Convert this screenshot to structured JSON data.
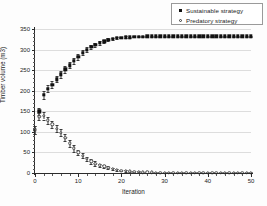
{
  "legend": {
    "position": "top-right",
    "entries": [
      {
        "label": "Sustainable strategy",
        "marker": "filled-square-icon"
      },
      {
        "label": "Predatory strategy",
        "marker": "open-circle-icon"
      }
    ]
  },
  "chart_data": {
    "type": "line",
    "title": "",
    "xlabel": "Iteration",
    "ylabel": "Timber volume (m3)",
    "xlim": [
      0,
      50
    ],
    "ylim": [
      0,
      350
    ],
    "xticks": [
      0,
      10,
      20,
      30,
      40,
      50
    ],
    "yticks": [
      0,
      50,
      100,
      150,
      200,
      250,
      300,
      350
    ],
    "grid": "horizontal",
    "marker_style": "points-with-error-bars",
    "x": [
      0,
      1,
      2,
      3,
      4,
      5,
      6,
      7,
      8,
      9,
      10,
      11,
      12,
      13,
      14,
      15,
      16,
      17,
      18,
      19,
      20,
      21,
      22,
      23,
      24,
      25,
      26,
      27,
      28,
      29,
      30,
      31,
      32,
      33,
      34,
      35,
      36,
      37,
      38,
      39,
      40,
      41,
      42,
      43,
      44,
      45,
      46,
      47,
      48,
      49,
      50
    ],
    "series": [
      {
        "name": "Sustainable strategy",
        "marker": "filled-square",
        "values": [
          105,
          150,
          190,
          205,
          215,
          228,
          240,
          252,
          262,
          272,
          282,
          292,
          300,
          306,
          312,
          316,
          320,
          324,
          326,
          328,
          329,
          330,
          330,
          331,
          331,
          331,
          332,
          332,
          332,
          332,
          332,
          332,
          332,
          332,
          332,
          332,
          332,
          332,
          332,
          332,
          332,
          332,
          332,
          332,
          332,
          332,
          332,
          332,
          332,
          332,
          332
        ],
        "errors": [
          10,
          9,
          9,
          8,
          8,
          8,
          8,
          8,
          8,
          7,
          7,
          6,
          6,
          5,
          5,
          4,
          4,
          3,
          3,
          2,
          2,
          2,
          1,
          1,
          1,
          1,
          1,
          1,
          1,
          1,
          1,
          1,
          1,
          1,
          1,
          1,
          1,
          1,
          1,
          1,
          1,
          1,
          1,
          1,
          1,
          1,
          1,
          1,
          1,
          1,
          1
        ]
      },
      {
        "name": "Predatory strategy",
        "marker": "open-circle",
        "values": [
          105,
          137,
          139,
          128,
          118,
          108,
          98,
          86,
          72,
          60,
          50,
          42,
          34,
          28,
          23,
          19,
          16,
          13,
          10,
          8,
          6,
          5,
          4,
          3,
          3,
          2,
          2,
          2,
          1,
          1,
          1,
          1,
          1,
          1,
          1,
          1,
          1,
          1,
          1,
          1,
          1,
          1,
          1,
          1,
          1,
          1,
          1,
          1,
          1,
          1,
          1
        ],
        "errors": [
          10,
          9,
          9,
          9,
          9,
          9,
          9,
          9,
          8,
          8,
          7,
          6,
          6,
          5,
          5,
          4,
          4,
          3,
          3,
          2,
          2,
          2,
          1,
          1,
          1,
          1,
          1,
          1,
          1,
          1,
          1,
          1,
          1,
          1,
          1,
          1,
          1,
          1,
          1,
          1,
          1,
          1,
          1,
          1,
          1,
          1,
          1,
          1,
          1,
          1,
          1
        ]
      }
    ],
    "colors": {
      "series_1": "#111111",
      "series_2": "#444444",
      "grid": "#dddddd",
      "axis": "#2b2b2b"
    }
  }
}
